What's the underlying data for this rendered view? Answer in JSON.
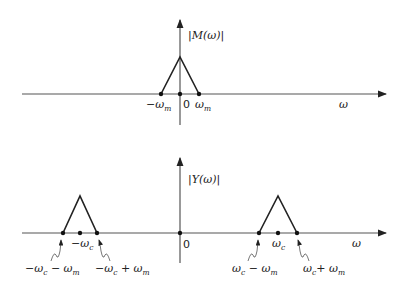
{
  "top_plot": {
    "ylabel_prefix": "|",
    "ylabel_main": "M(ω)",
    "ylabel_suffix": "|",
    "xlabel": "ω",
    "ticks": [
      {
        "main": "−ω",
        "sub": "m"
      },
      {
        "main": "0",
        "sub": ""
      },
      {
        "main": "ω",
        "sub": "m"
      }
    ]
  },
  "bottom_plot": {
    "ylabel_prefix": "|",
    "ylabel_main": "Y(ω)",
    "ylabel_suffix": "|",
    "xlabel": "ω",
    "origin": "0",
    "left_center": {
      "main": "−ω",
      "sub": "c"
    },
    "right_center": {
      "main": "ω",
      "sub": "c"
    },
    "left_low": {
      "a": "−ω",
      "asub": "c",
      "op": " − ω",
      "bsub": "m"
    },
    "left_high": {
      "a": "−ω",
      "asub": "c",
      "op": " + ω",
      "bsub": "m"
    },
    "right_low": {
      "a": "ω",
      "asub": "c",
      "op": " − ω",
      "bsub": "m"
    },
    "right_high": {
      "a": "ω",
      "asub": "c",
      "op": "+ ω",
      "bsub": "m"
    }
  }
}
